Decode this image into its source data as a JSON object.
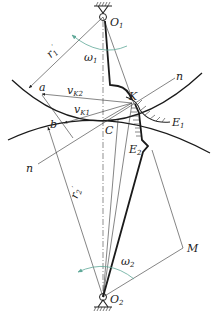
{
  "diagram": {
    "type": "gear-meshing-kinematics",
    "labels": {
      "O1": {
        "main": "O",
        "sub": "1"
      },
      "O2": {
        "main": "O",
        "sub": "2"
      },
      "omega1": {
        "main": "ω",
        "sub": "1"
      },
      "omega2": {
        "main": "ω",
        "sub": "2"
      },
      "r1": {
        "main": "r",
        "sub": "1",
        "sup": "′"
      },
      "r2": {
        "main": "r",
        "sub": "2",
        "sup": "′"
      },
      "a": "a",
      "b": "b",
      "vK2": {
        "main": "v",
        "sub": "K2"
      },
      "vK1": {
        "main": "v",
        "sub": "K1"
      },
      "K": "K",
      "C": "C",
      "n_top": "n",
      "n_bottom": "n",
      "E1": {
        "main": "E",
        "sub": "1"
      },
      "E2": {
        "main": "E",
        "sub": "2"
      },
      "M": "M"
    },
    "colors": {
      "line": "#1a1a1a",
      "omega_arrow": "#5fa898",
      "background": "#ffffff"
    }
  }
}
